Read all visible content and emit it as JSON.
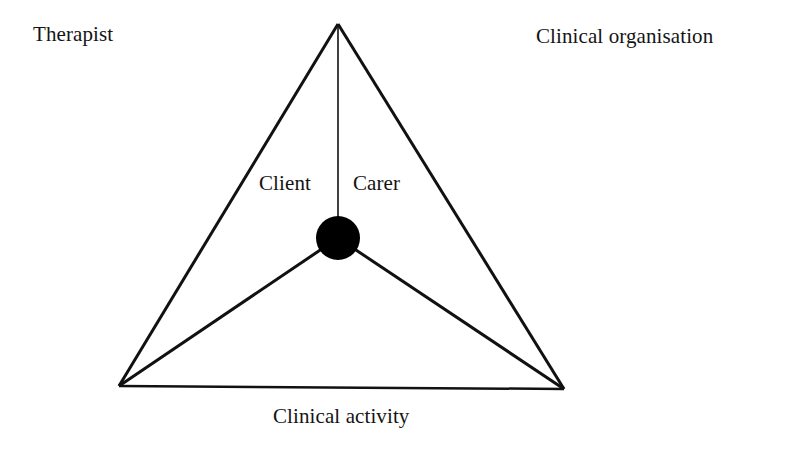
{
  "diagram": {
    "type": "activity-system-triangle",
    "nodes": {
      "top_left_label": "Therapist",
      "top_right_label": "Clinical organisation",
      "bottom_label": "Clinical activity",
      "center_left_label": "Client",
      "center_right_label": "Carer"
    },
    "colors": {
      "line": "#111111",
      "center_dot": "#000000",
      "background": "#ffffff"
    },
    "geometry": {
      "apex": [
        338,
        24
      ],
      "bottom_left": [
        119,
        386
      ],
      "bottom_right": [
        564,
        389
      ],
      "center": [
        338,
        238
      ],
      "center_radius": 22
    }
  }
}
